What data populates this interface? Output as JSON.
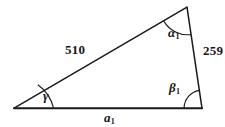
{
  "figure": {
    "type": "triangle-diagram",
    "stroke_color": "#1a1a1a",
    "background_color": "#ffffff",
    "text_color": "#151515"
  },
  "vertices": {
    "left": {
      "name": "left-vertex",
      "x": 14,
      "y": 108
    },
    "apex": {
      "name": "apex-vertex",
      "x": 187,
      "y": 7
    },
    "right": {
      "name": "right-vertex",
      "x": 202,
      "y": 108
    }
  },
  "sides": [
    {
      "name": "side-510",
      "label": "510",
      "from": "left",
      "to": "apex",
      "label_x": 65,
      "label_y": 43
    },
    {
      "name": "side-259",
      "label": "259",
      "from": "apex",
      "to": "right",
      "label_x": 203,
      "label_y": 44
    },
    {
      "name": "side-a1",
      "label": "a",
      "subscript": "1",
      "from": "left",
      "to": "right",
      "label_x": 104,
      "label_y": 111
    }
  ],
  "angles": [
    {
      "name": "angle-alpha1",
      "label": "α",
      "subscript": "1",
      "at": "apex",
      "label_x": 168,
      "label_y": 26
    },
    {
      "name": "angle-beta1",
      "label": "β",
      "subscript": "1",
      "at": "right",
      "label_x": 169,
      "label_y": 81
    },
    {
      "name": "angle-gamma",
      "label": "γ",
      "subscript": "",
      "at": "left",
      "label_x": 43,
      "label_y": 89
    }
  ],
  "labels": {
    "side_510": "510",
    "side_259": "259",
    "side_a_base": "a",
    "side_a_sub": "1",
    "angle_alpha": "α",
    "angle_alpha_sub": "1",
    "angle_beta": "β",
    "angle_beta_sub": "1",
    "angle_gamma": "γ"
  }
}
